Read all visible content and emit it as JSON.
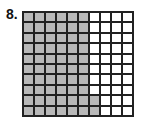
{
  "problem": {
    "number_label": "8.",
    "grid": {
      "rows": 10,
      "cols": 10,
      "shaded_cells": 62,
      "description": "First 6 columns fully shaded; bottom 2 rows also shade column 7",
      "shade_color": "#b9b9b9",
      "unshaded_color": "#ffffff",
      "line_color": "#222222"
    }
  }
}
